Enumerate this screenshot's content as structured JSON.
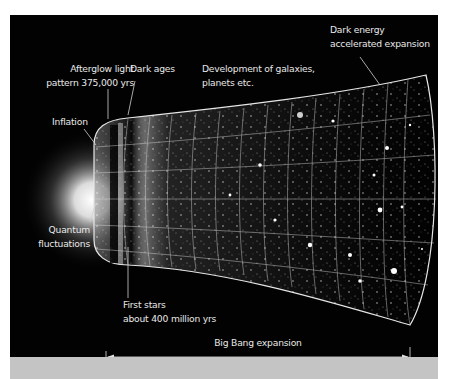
{
  "figure": {
    "background_color": "#020202",
    "band_color": "#c4c4c4",
    "text_color": "#e8e8e8"
  },
  "labels": {
    "afterglow": {
      "line1": "Afterglow light",
      "line2": "pattern 375,000 yrs"
    },
    "dark_ages": {
      "line1": "Dark ages"
    },
    "development": {
      "line1": "Development of galaxies,",
      "line2": "planets etc."
    },
    "dark_energy": {
      "line1": "Dark energy",
      "line2": "accelerated expansion"
    },
    "inflation": {
      "line1": "Inflation"
    },
    "quantum": {
      "line1": "Quantum",
      "line2": "fluctuations"
    },
    "first_stars": {
      "line1": "First stars",
      "line2": "about 400 million yrs"
    }
  },
  "timeline": {
    "caption_top": "Big Bang expansion",
    "caption_bottom": "13.77 billion years"
  }
}
